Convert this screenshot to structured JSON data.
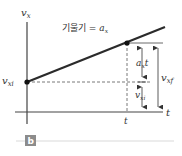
{
  "figure": {
    "y_axis_label": "v",
    "y_axis_sub": "x",
    "x_axis_label": "t",
    "slope_label_prefix": "기울기 = ",
    "slope_label_var": "a",
    "slope_label_sub": "x",
    "intercept_label": "v",
    "intercept_sub": "xi",
    "time_mark_label": "t",
    "delta_label_var": "a",
    "delta_label_sub": "x",
    "delta_label_suffix": "t",
    "vxi_bracket_label": "v",
    "vxi_bracket_sub": "xi",
    "vxf_label": "v",
    "vxf_sub": "xf",
    "panel_badge": "b"
  },
  "colors": {
    "line": "#2b2b2b",
    "axis": "#444444",
    "dash": "#555555",
    "badge": "#8c8c8c",
    "rule": "#d9d9d9"
  }
}
